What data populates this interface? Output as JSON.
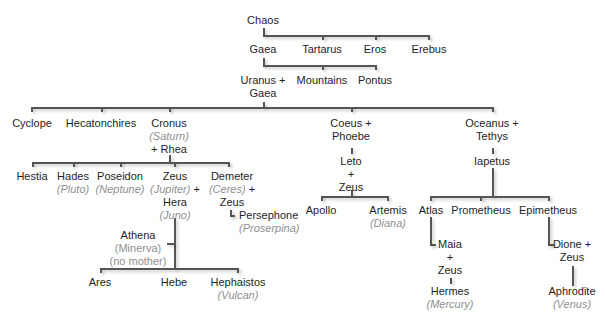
{
  "tree": {
    "chaos": "Chaos",
    "gaea": "Gaea",
    "tartarus": "Tartarus",
    "eros": "Eros",
    "erebus": "Erebus",
    "uranus_gaea": [
      "Uranus +",
      "Gaea"
    ],
    "mountains": "Mountains",
    "pontus": "Pontus",
    "cyclope": "Cyclope",
    "hecatonchires": "Hecatonchires",
    "cronus": {
      "name": "Cronus",
      "roman": "(Saturn)",
      "spouse": "+ Rhea"
    },
    "coeus_phoebe": [
      "Coeus +",
      "Phoebe"
    ],
    "leto_zeus": [
      "Leto",
      "+",
      "Zeus"
    ],
    "oceanus_tethys": [
      "Oceanus +",
      "Tethys"
    ],
    "iapetus": "Iapetus",
    "hestia": "Hestia",
    "hades": {
      "name": "Hades",
      "roman": "(Pluto)"
    },
    "poseidon": {
      "name": "Poseidon",
      "roman": "(Neptune)"
    },
    "zeus": {
      "name": "Zeus",
      "roman": "(Jupiter)",
      "plus": " +",
      "spouse": "Hera",
      "spouse_roman": "(Juno)"
    },
    "demeter": {
      "name": "Demeter",
      "roman": "(Ceres)",
      "plus": " +",
      "spouse": "Zeus"
    },
    "persephone": {
      "name": "Persephone",
      "roman": "(Proserpina)"
    },
    "athena": {
      "name": "Athena",
      "roman": "(Minerva)",
      "note": "(no mother)"
    },
    "ares": "Ares",
    "hebe": "Hebe",
    "hephaistos": {
      "name": "Hephaistos",
      "roman": "(Vulcan)"
    },
    "apollo": "Apollo",
    "artemis": {
      "name": "Artemis",
      "roman": "(Diana)"
    },
    "atlas": "Atlas",
    "prometheus": "Prometheus",
    "epimetheus": "Epimetheus",
    "maia_zeus": [
      "Maia",
      "+",
      "Zeus"
    ],
    "hermes": {
      "name": "Hermes",
      "roman": "(Mercury)"
    },
    "dione_zeus": [
      "Dione +",
      "Zeus"
    ],
    "aphrodite": {
      "name": "Aphrodite",
      "roman": "(Venus)"
    }
  },
  "colors": {
    "line": "#555555",
    "text": "#1e1e1e",
    "roman": "#8f8f8f"
  }
}
